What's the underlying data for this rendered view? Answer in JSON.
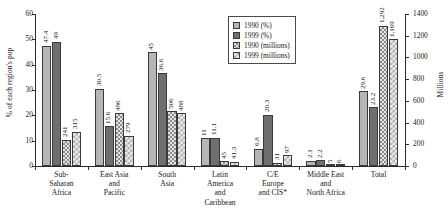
{
  "chart_data": {
    "type": "bar",
    "title": "",
    "categories": [
      "Sub-\nSaharan\nAfrica",
      "East Asia\nand\nPacific",
      "South\nAsia",
      "Latin\nAmerica\nand\nCaribbean",
      "C/E\nEurope\nand CIS*",
      "Middle East\nand\nNorth Africa",
      "Total"
    ],
    "series": [
      {
        "name": "1990 (%)",
        "axis": "left",
        "values": [
          47.4,
          30.5,
          45,
          11,
          6.8,
          2.1,
          29.6
        ],
        "labels": [
          "47.4",
          "30.5",
          "45",
          "11",
          "6.8",
          "2.1",
          "29.6"
        ]
      },
      {
        "name": "1999 (%)",
        "axis": "left",
        "values": [
          49,
          15.6,
          36.6,
          11.1,
          20.3,
          2.2,
          23.2
        ],
        "labels": [
          "49",
          "15.6",
          "36.6",
          "11.1",
          "20.3",
          "2.2",
          "23.2"
        ]
      },
      {
        "name": "1990 (millions)",
        "axis": "right",
        "values": [
          241,
          486,
          506,
          45,
          31,
          5,
          1292
        ],
        "labels": [
          "241",
          "486",
          "506",
          "45",
          "31",
          "5",
          "1,292"
        ]
      },
      {
        "name": "1999 (millions)",
        "axis": "right",
        "values": [
          315,
          279,
          488,
          41.3,
          97,
          6,
          1169
        ],
        "labels": [
          "315",
          "279",
          "488",
          "41.3",
          "97",
          "6",
          "1,169"
        ]
      }
    ],
    "ylabel": "% of each region's pop",
    "ylabel_right": "Millions",
    "xlabel": "",
    "ylim": [
      0,
      60
    ],
    "ylim_right": [
      0,
      1400
    ],
    "yticks": [
      0,
      10,
      20,
      30,
      40,
      50,
      60
    ],
    "yticks_right": [
      0,
      200,
      400,
      600,
      800,
      1000,
      1200,
      1400
    ],
    "ytick_labels": [
      "0",
      "10",
      "20",
      "30",
      "40",
      "50",
      "60"
    ],
    "ytick_labels_right": [
      "0",
      "200",
      "400",
      "600",
      "800",
      "1000",
      "1200",
      "1400"
    ],
    "grid": false,
    "legend_position": "top-right",
    "legend": [
      "1990 (%)",
      "1999 (%)",
      "1990 (millions)",
      "1999 (millions)"
    ]
  }
}
